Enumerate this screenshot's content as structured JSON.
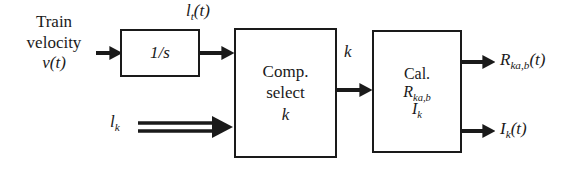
{
  "diagram": {
    "type": "block-diagram",
    "background_color": "#ffffff",
    "line_color": "#1a1a1a",
    "blocks": [
      {
        "id": "integrator",
        "lines": [
          "1/s"
        ],
        "x": 120,
        "y": 29,
        "w": 80,
        "h": 48
      },
      {
        "id": "comp-select",
        "lines": [
          "Comp.",
          "select",
          "k"
        ],
        "x": 234,
        "y": 28,
        "w": 103,
        "h": 130
      },
      {
        "id": "calculate",
        "lines": [
          "Cal.",
          "R",
          "I"
        ],
        "x": 372,
        "y": 30,
        "w": 90,
        "h": 123
      }
    ],
    "labels": {
      "input_train_velocity_line1": "Train",
      "input_train_velocity_line2": "velocity",
      "input_train_velocity_line3": "v(t)",
      "signal_lt": "l",
      "signal_lt_sub": "t",
      "signal_lt_arg": "(t)",
      "input_lk": "l",
      "input_lk_sub": "k",
      "signal_k": "k",
      "output_r_base": "R",
      "output_r_sub": "ka,b",
      "output_r_arg": "(t)",
      "output_i_base": "I",
      "output_i_sub": "k",
      "output_i_arg": "(t)",
      "block_integrator_text": "1/s",
      "block_comp_select_line1": "Comp.",
      "block_comp_select_line2": "select",
      "block_comp_select_line3": "k",
      "block_cal_line1": "Cal.",
      "block_cal_line2_base": "R",
      "block_cal_line2_sub": "ka,b",
      "block_cal_line3_base": "I",
      "block_cal_line3_sub": "k"
    },
    "arrows": [
      {
        "id": "velocity-to-integrator",
        "style": "solid",
        "from_x": 96,
        "to_x": 120,
        "y": 53
      },
      {
        "id": "integrator-to-comp-select",
        "style": "solid",
        "from_x": 200,
        "to_x": 234,
        "y": 53
      },
      {
        "id": "lk-to-comp-select",
        "style": "double",
        "from_x": 136,
        "to_x": 234,
        "y": 127
      },
      {
        "id": "comp-select-to-calculate",
        "style": "solid",
        "from_x": 337,
        "to_x": 372,
        "y": 90
      },
      {
        "id": "calculate-to-output-r",
        "style": "solid",
        "from_x": 462,
        "to_x": 496,
        "y": 62
      },
      {
        "id": "calculate-to-output-i",
        "style": "solid",
        "from_x": 462,
        "to_x": 496,
        "y": 131
      }
    ]
  }
}
